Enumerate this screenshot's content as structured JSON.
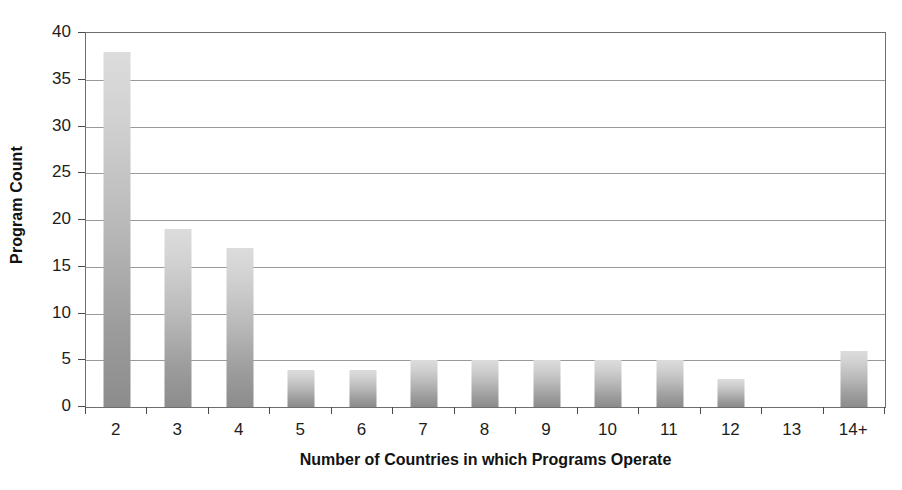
{
  "chart_data": {
    "type": "bar",
    "title": "",
    "xlabel": "Number of Countries in which Programs Operate",
    "ylabel": "Program Count",
    "categories": [
      "2",
      "3",
      "4",
      "5",
      "6",
      "7",
      "8",
      "9",
      "10",
      "11",
      "12",
      "13",
      "14+"
    ],
    "values": [
      38,
      19,
      17,
      4,
      4,
      5,
      5,
      5,
      5,
      5,
      3,
      0,
      6
    ],
    "ylim": [
      0,
      40
    ],
    "yticks": [
      0,
      5,
      10,
      15,
      20,
      25,
      30,
      35,
      40
    ],
    "ytick_labels": [
      "0",
      "5",
      "10",
      "15",
      "20",
      "25",
      "30",
      "35",
      "40"
    ],
    "grid": true,
    "grid_axis": "y",
    "legend": false,
    "bar_color_top": "#dcdcdc",
    "bar_color_bottom": "#8c8c8c",
    "axis_color": "#6e6e6e",
    "grid_color": "#9a9a9a",
    "text_color": "#1a1a1a"
  }
}
